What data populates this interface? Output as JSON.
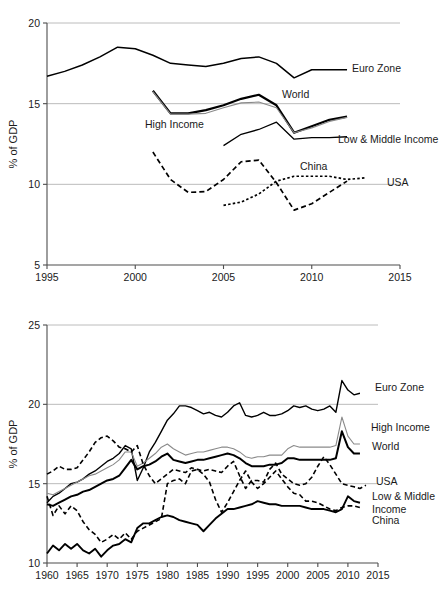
{
  "figure": {
    "axis_title": "% of GDP",
    "series_colors": {
      "euro_zone": "#000000",
      "high_income": "#8a8a8a",
      "world": "#000000",
      "low_middle_income": "#000000",
      "china": "#000000",
      "usa": "#000000"
    }
  },
  "chart_data": [
    {
      "type": "line",
      "title": "",
      "xlabel": "",
      "ylabel": "% of GDP",
      "xlim": [
        1995,
        2015
      ],
      "ylim": [
        5,
        20
      ],
      "xticks": [
        1995,
        2000,
        2005,
        2010,
        2015
      ],
      "yticks": [
        5,
        10,
        15,
        20
      ],
      "grid": true,
      "legend_position": "inline-right",
      "annotations": [
        "Euro Zone",
        "World",
        "High Income",
        "Low & Middle Income",
        "China",
        "USA"
      ],
      "series": [
        {
          "name": "Euro Zone",
          "style": "solid",
          "width": 1.5,
          "color": "#000000",
          "x": [
            1995,
            1996,
            1997,
            1998,
            1999,
            2000,
            2001,
            2002,
            2003,
            2004,
            2005,
            2006,
            2007,
            2008,
            2009,
            2010,
            2011,
            2012
          ],
          "values": [
            16.7,
            17.0,
            17.4,
            17.9,
            18.5,
            18.4,
            18.0,
            17.5,
            17.4,
            17.3,
            17.5,
            17.8,
            17.9,
            17.5,
            16.6,
            17.1,
            17.1,
            17.1
          ]
        },
        {
          "name": "World",
          "style": "solid",
          "width": 2.2,
          "color": "#000000",
          "x": [
            2001,
            2002,
            2003,
            2004,
            2005,
            2006,
            2007,
            2008,
            2009,
            2010,
            2011,
            2012
          ],
          "values": [
            15.8,
            14.4,
            14.4,
            14.6,
            14.9,
            15.3,
            15.55,
            14.9,
            13.2,
            13.6,
            14.0,
            14.2
          ]
        },
        {
          "name": "High Income",
          "style": "solid",
          "width": 1.1,
          "color": "#8a8a8a",
          "x": [
            2001,
            2002,
            2003,
            2004,
            2005,
            2006,
            2007,
            2008,
            2009,
            2010,
            2011,
            2012
          ],
          "values": [
            15.75,
            14.35,
            14.35,
            14.4,
            14.75,
            15.05,
            15.1,
            14.75,
            13.2,
            13.5,
            13.9,
            14.15
          ]
        },
        {
          "name": "Low & Middle Income",
          "style": "solid",
          "width": 1.3,
          "color": "#000000",
          "x": [
            2005,
            2006,
            2007,
            2008,
            2009,
            2010,
            2011,
            2012
          ],
          "values": [
            12.4,
            13.1,
            13.4,
            13.85,
            12.8,
            12.9,
            12.9,
            12.95
          ]
        },
        {
          "name": "China",
          "style": "dashed",
          "width": 1.7,
          "color": "#000000",
          "x": [
            2001,
            2002,
            2003,
            2004,
            2005,
            2006,
            2007,
            2008,
            2009,
            2010,
            2011,
            2012
          ],
          "values": [
            12.0,
            10.3,
            9.5,
            9.55,
            10.3,
            11.4,
            11.5,
            10.1,
            8.4,
            8.8,
            9.5,
            10.2
          ]
        },
        {
          "name": "USA",
          "style": "dotted",
          "width": 1.7,
          "color": "#000000",
          "x": [
            2005,
            2006,
            2007,
            2008,
            2009,
            2010,
            2011,
            2012,
            2013
          ],
          "values": [
            8.7,
            8.9,
            9.4,
            10.2,
            10.5,
            10.5,
            10.5,
            10.3,
            10.4
          ]
        }
      ]
    },
    {
      "type": "line",
      "title": "",
      "xlabel": "",
      "ylabel": "% of GDP",
      "xlim": [
        1960,
        2015
      ],
      "ylim": [
        10,
        25
      ],
      "xticks": [
        1960,
        1965,
        1970,
        1975,
        1980,
        1985,
        1990,
        1995,
        2000,
        2005,
        2010,
        2015
      ],
      "yticks": [
        10,
        15,
        20,
        25
      ],
      "grid": true,
      "legend_position": "inline-right",
      "annotations": [
        "Euro Zone",
        "High Income",
        "World",
        "USA",
        "Low & Middle Income",
        "China"
      ],
      "series": [
        {
          "name": "Euro Zone",
          "style": "solid",
          "width": 1.4,
          "color": "#000000",
          "x": [
            1960,
            1961,
            1962,
            1963,
            1964,
            1965,
            1966,
            1967,
            1968,
            1969,
            1970,
            1971,
            1972,
            1973,
            1974,
            1975,
            1976,
            1977,
            1978,
            1979,
            1980,
            1981,
            1982,
            1983,
            1984,
            1985,
            1986,
            1987,
            1988,
            1989,
            1990,
            1991,
            1992,
            1993,
            1994,
            1995,
            1996,
            1997,
            1998,
            1999,
            2000,
            2001,
            2002,
            2003,
            2004,
            2005,
            2006,
            2007,
            2008,
            2009,
            2010,
            2011,
            2012
          ],
          "values": [
            13.8,
            14.2,
            14.4,
            14.7,
            15.0,
            15.1,
            15.3,
            15.6,
            15.8,
            16.1,
            16.4,
            16.6,
            16.9,
            17.4,
            17.2,
            15.2,
            16.0,
            17.0,
            17.6,
            18.3,
            19.0,
            19.4,
            19.9,
            19.9,
            19.8,
            19.6,
            19.4,
            19.5,
            19.3,
            19.2,
            19.5,
            19.9,
            20.1,
            19.3,
            19.2,
            19.3,
            19.5,
            19.3,
            19.3,
            19.4,
            19.6,
            19.9,
            19.8,
            19.9,
            19.7,
            19.6,
            19.7,
            19.9,
            19.5,
            21.5,
            20.9,
            20.6,
            20.7
          ]
        },
        {
          "name": "High Income",
          "style": "solid",
          "width": 1.1,
          "color": "#8a8a8a",
          "x": [
            1960,
            1961,
            1962,
            1963,
            1964,
            1965,
            1966,
            1967,
            1968,
            1969,
            1970,
            1971,
            1972,
            1973,
            1974,
            1975,
            1976,
            1977,
            1978,
            1979,
            1980,
            1981,
            1982,
            1983,
            1984,
            1985,
            1986,
            1987,
            1988,
            1989,
            1990,
            1991,
            1992,
            1993,
            1994,
            1995,
            1996,
            1997,
            1998,
            1999,
            2000,
            2001,
            2002,
            2003,
            2004,
            2005,
            2006,
            2007,
            2008,
            2009,
            2010,
            2011,
            2012
          ],
          "values": [
            14.4,
            14.3,
            14.5,
            14.7,
            14.9,
            15.1,
            15.3,
            15.5,
            15.6,
            15.8,
            16.0,
            16.2,
            16.5,
            17.0,
            17.0,
            16.1,
            16.3,
            16.6,
            16.9,
            17.3,
            17.5,
            17.2,
            17.0,
            16.8,
            16.9,
            17.0,
            17.0,
            17.1,
            17.2,
            17.3,
            17.3,
            17.2,
            17.0,
            16.7,
            16.6,
            16.7,
            16.7,
            16.8,
            16.8,
            16.8,
            17.2,
            17.4,
            17.3,
            17.3,
            17.3,
            17.3,
            17.3,
            17.3,
            17.4,
            19.2,
            18.0,
            17.5,
            17.5
          ]
        },
        {
          "name": "World",
          "style": "solid",
          "width": 2.0,
          "color": "#000000",
          "x": [
            1960,
            1961,
            1962,
            1963,
            1964,
            1965,
            1966,
            1967,
            1968,
            1969,
            1970,
            1971,
            1972,
            1973,
            1974,
            1975,
            1976,
            1977,
            1978,
            1979,
            1980,
            1981,
            1982,
            1983,
            1984,
            1985,
            1986,
            1987,
            1988,
            1989,
            1990,
            1991,
            1992,
            1993,
            1994,
            1995,
            1996,
            1997,
            1998,
            1999,
            2000,
            2001,
            2002,
            2003,
            2004,
            2005,
            2006,
            2007,
            2008,
            2009,
            2010,
            2011,
            2012
          ],
          "values": [
            13.7,
            13.6,
            13.8,
            14.0,
            14.2,
            14.3,
            14.5,
            14.6,
            14.8,
            15.0,
            15.2,
            15.3,
            15.5,
            16.0,
            16.5,
            15.9,
            16.1,
            16.2,
            16.4,
            16.7,
            16.9,
            16.5,
            16.4,
            16.3,
            16.4,
            16.5,
            16.5,
            16.6,
            16.7,
            16.8,
            16.9,
            16.8,
            16.6,
            16.3,
            16.1,
            16.1,
            16.1,
            16.2,
            16.2,
            16.3,
            16.6,
            16.6,
            16.5,
            16.5,
            16.5,
            16.5,
            16.5,
            16.5,
            16.6,
            18.3,
            17.3,
            16.9,
            16.9
          ]
        },
        {
          "name": "USA",
          "style": "dashed",
          "width": 1.6,
          "color": "#000000",
          "x": [
            1960,
            1961,
            1962,
            1963,
            1964,
            1965,
            1966,
            1967,
            1968,
            1969,
            1970,
            1971,
            1972,
            1973,
            1974,
            1975,
            1976,
            1977,
            1978,
            1979,
            1980,
            1981,
            1982,
            1983,
            1984,
            1985,
            1986,
            1987,
            1988,
            1989,
            1990,
            1991,
            1992,
            1993,
            1994,
            1995,
            1996,
            1997,
            1998,
            1999,
            2000,
            2001,
            2002,
            2003,
            2004,
            2005,
            2006,
            2007,
            2008,
            2009,
            2010,
            2011,
            2012,
            2013
          ],
          "values": [
            15.6,
            15.8,
            16.1,
            15.9,
            15.9,
            16.0,
            16.5,
            17.0,
            17.6,
            17.9,
            18.0,
            17.7,
            17.3,
            17.2,
            17.0,
            17.4,
            16.2,
            15.5,
            15.0,
            15.3,
            15.6,
            15.9,
            15.8,
            15.7,
            16.0,
            15.9,
            15.8,
            15.9,
            15.8,
            15.7,
            16.1,
            16.4,
            15.5,
            14.7,
            15.2,
            15.2,
            15.1,
            15.9,
            16.3,
            15.6,
            15.3,
            15.0,
            14.9,
            15.0,
            15.4,
            16.1,
            16.7,
            16.2,
            15.6,
            15.0,
            14.9,
            14.8,
            14.7,
            14.9
          ]
        },
        {
          "name": "Low & Middle Income",
          "style": "solid",
          "width": 1.9,
          "color": "#000000",
          "x": [
            1960,
            1961,
            1962,
            1963,
            1964,
            1965,
            1966,
            1967,
            1968,
            1969,
            1970,
            1971,
            1972,
            1973,
            1974,
            1975,
            1976,
            1977,
            1978,
            1979,
            1980,
            1981,
            1982,
            1983,
            1984,
            1985,
            1986,
            1987,
            1988,
            1989,
            1990,
            1991,
            1992,
            1993,
            1994,
            1995,
            1996,
            1997,
            1998,
            1999,
            2000,
            2001,
            2002,
            2003,
            2004,
            2005,
            2006,
            2007,
            2008,
            2009,
            2010,
            2011,
            2012
          ],
          "values": [
            10.6,
            11.1,
            10.8,
            11.2,
            10.9,
            11.2,
            10.8,
            10.6,
            10.9,
            10.4,
            10.8,
            11.1,
            11.2,
            11.5,
            11.3,
            12.2,
            12.5,
            12.5,
            12.7,
            12.9,
            13.0,
            12.9,
            12.7,
            12.6,
            12.5,
            12.4,
            12.0,
            12.4,
            12.8,
            13.1,
            13.4,
            13.4,
            13.5,
            13.6,
            13.7,
            13.9,
            13.8,
            13.7,
            13.7,
            13.6,
            13.6,
            13.6,
            13.6,
            13.5,
            13.4,
            13.4,
            13.4,
            13.3,
            13.2,
            13.4,
            14.2,
            13.9,
            13.8
          ]
        },
        {
          "name": "China",
          "style": "dashed",
          "width": 1.6,
          "color": "#000000",
          "x": [
            1960,
            1961,
            1962,
            1963,
            1964,
            1965,
            1966,
            1967,
            1968,
            1969,
            1970,
            1971,
            1972,
            1973,
            1974,
            1975,
            1976,
            1977,
            1978,
            1979,
            1980,
            1981,
            1982,
            1983,
            1984,
            1985,
            1986,
            1987,
            1988,
            1989,
            1990,
            1991,
            1992,
            1993,
            1994,
            1995,
            1996,
            1997,
            1998,
            1999,
            2000,
            2001,
            2002,
            2003,
            2004,
            2005,
            2006,
            2007,
            2008,
            2009,
            2010,
            2011,
            2012
          ],
          "values": [
            14.2,
            13.0,
            13.6,
            13.1,
            13.6,
            13.3,
            12.6,
            12.1,
            11.8,
            11.3,
            11.5,
            11.8,
            11.5,
            11.9,
            11.5,
            12.0,
            12.2,
            12.4,
            12.6,
            12.8,
            15.0,
            15.2,
            15.3,
            15.0,
            15.8,
            15.9,
            15.6,
            15.1,
            14.0,
            13.2,
            13.8,
            14.5,
            15.2,
            15.8,
            15.1,
            14.7,
            15.0,
            15.4,
            15.8,
            15.3,
            14.8,
            14.4,
            14.3,
            13.9,
            13.9,
            13.8,
            13.6,
            13.4,
            13.3,
            13.5,
            13.6,
            13.6,
            13.5
          ]
        }
      ]
    }
  ],
  "labels_top": [
    {
      "text": "Euro Zone",
      "x": 352,
      "y": 72
    },
    {
      "text": "World",
      "x": 282,
      "y": 98
    },
    {
      "text": "High Income",
      "x": 145,
      "y": 128
    },
    {
      "text": "Low & Middle Income",
      "x": 338,
      "y": 143
    },
    {
      "text": "China",
      "x": 300,
      "y": 170
    },
    {
      "text": "USA",
      "x": 387,
      "y": 186
    }
  ],
  "labels_bottom": [
    {
      "text": "Euro Zone",
      "x": 375,
      "y": 391
    },
    {
      "text": "High Income",
      "x": 371,
      "y": 431
    },
    {
      "text": "World",
      "x": 372,
      "y": 450
    },
    {
      "text": "USA",
      "x": 376,
      "y": 485
    },
    {
      "text": "Low & Middle",
      "x": 372,
      "y": 500
    },
    {
      "text": "Income",
      "x": 372,
      "y": 513
    },
    {
      "text": "China",
      "x": 372,
      "y": 524
    }
  ]
}
